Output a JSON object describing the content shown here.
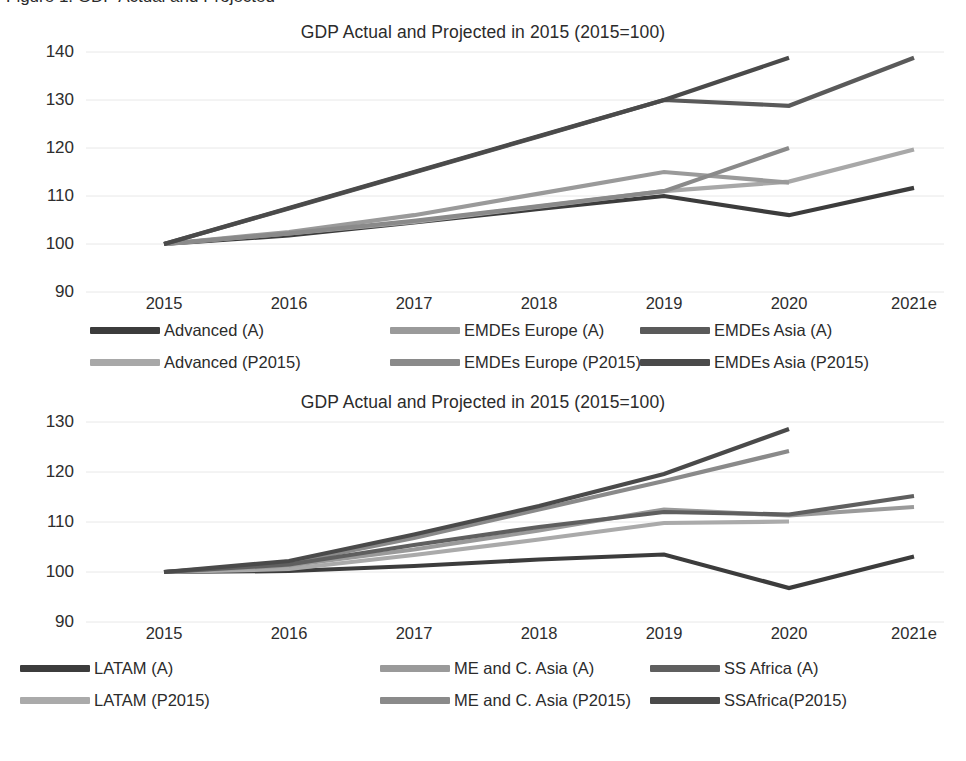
{
  "document": {
    "caption_partial": "Figure 1. GDP Actual and Projected"
  },
  "charts": [
    {
      "id": "chart-top",
      "title": "GDP Actual and Projected in 2015 (2015=100)",
      "y_ticks": [
        "140",
        "130",
        "120",
        "110",
        "100",
        "90"
      ],
      "x_ticks": [
        "2015",
        "2016",
        "2017",
        "2018",
        "2019",
        "2020",
        "2021e"
      ],
      "legend": [
        {
          "label": "Advanced (A)",
          "color": "#3c3c3c"
        },
        {
          "label": "EMDEs Europe (A)",
          "color": "#9a9a9a"
        },
        {
          "label": "EMDEs Asia (A)",
          "color": "#5a5a5a"
        },
        {
          "label": "Advanced (P2015)",
          "color": "#a8a8a8"
        },
        {
          "label": "EMDEs Europe (P2015)",
          "color": "#8a8a8a"
        },
        {
          "label": "EMDEs Asia (P2015)",
          "color": "#4a4a4a"
        }
      ]
    },
    {
      "id": "chart-bottom",
      "title": "GDP Actual and Projected in 2015 (2015=100)",
      "y_ticks": [
        "130",
        "120",
        "110",
        "100",
        "90"
      ],
      "x_ticks": [
        "2015",
        "2016",
        "2017",
        "2018",
        "2019",
        "2020",
        "2021e"
      ],
      "legend": [
        {
          "label": "LATAM (A)",
          "color": "#3c3c3c"
        },
        {
          "label": "ME and C. Asia (A)",
          "color": "#9a9a9a"
        },
        {
          "label": "SS Africa (A)",
          "color": "#5f5f5f"
        },
        {
          "label": "LATAM (P2015)",
          "color": "#aaaaaa"
        },
        {
          "label": "ME and C. Asia (P2015)",
          "color": "#8a8a8a"
        },
        {
          "label": "SSAfrica(P2015)",
          "color": "#4a4a4a"
        }
      ]
    }
  ],
  "chart_data": [
    {
      "type": "line",
      "title": "GDP Actual and Projected in 2015 (2015=100)",
      "xlabel": "",
      "ylabel": "",
      "ylim": [
        90,
        140
      ],
      "grid": true,
      "legend_position": "bottom",
      "categories": [
        "2015",
        "2016",
        "2017",
        "2018",
        "2019",
        "2020",
        "2021e"
      ],
      "series": [
        {
          "name": "Advanced (A)",
          "color": "#3c3c3c",
          "values": [
            100,
            101.8,
            104.5,
            107.3,
            110.0,
            106.0,
            111.7
          ]
        },
        {
          "name": "Advanced (P2015)",
          "color": "#a8a8a8",
          "values": [
            100,
            102.2,
            104.6,
            107.8,
            111.0,
            113.0,
            119.7
          ]
        },
        {
          "name": "EMDEs Europe (A)",
          "color": "#9a9a9a",
          "values": [
            100,
            102.5,
            106.0,
            110.5,
            115.0,
            112.8,
            null
          ]
        },
        {
          "name": "EMDEs Europe (P2015)",
          "color": "#8a8a8a",
          "values": [
            100,
            102.2,
            104.8,
            107.9,
            111.0,
            120.0,
            null
          ]
        },
        {
          "name": "EMDEs Asia (A)",
          "color": "#5a5a5a",
          "values": [
            100,
            107.4,
            114.9,
            122.4,
            130.0,
            128.8,
            138.8
          ]
        },
        {
          "name": "EMDEs Asia (P2015)",
          "color": "#4a4a4a",
          "values": [
            100,
            107.5,
            115.0,
            122.5,
            130.0,
            138.8,
            null
          ]
        }
      ]
    },
    {
      "type": "line",
      "title": "GDP Actual and Projected in 2015 (2015=100)",
      "xlabel": "",
      "ylabel": "",
      "ylim": [
        90,
        130
      ],
      "grid": true,
      "legend_position": "bottom",
      "categories": [
        "2015",
        "2016",
        "2017",
        "2018",
        "2019",
        "2020",
        "2021e"
      ],
      "series": [
        {
          "name": "LATAM (A)",
          "color": "#3c3c3c",
          "values": [
            100,
            100.2,
            101.2,
            102.5,
            103.5,
            96.8,
            103.1
          ]
        },
        {
          "name": "LATAM (P2015)",
          "color": "#aaaaaa",
          "values": [
            100,
            100.6,
            103.4,
            106.5,
            109.8,
            110.1,
            null
          ]
        },
        {
          "name": "ME and C. Asia (A)",
          "color": "#9a9a9a",
          "values": [
            100,
            101.3,
            104.5,
            108.3,
            112.5,
            111.3,
            113.0
          ]
        },
        {
          "name": "ME and C. Asia (P2015)",
          "color": "#8a8a8a",
          "values": [
            100,
            101.8,
            106.8,
            112.5,
            118.2,
            124.2,
            null
          ]
        },
        {
          "name": "SS Africa (A)",
          "color": "#5f5f5f",
          "values": [
            100,
            101.5,
            105.4,
            109.0,
            112.0,
            111.5,
            115.2
          ]
        },
        {
          "name": "SSAfrica(P2015)",
          "color": "#4a4a4a",
          "values": [
            100,
            102.2,
            107.5,
            113.2,
            119.6,
            128.6,
            null
          ]
        }
      ]
    }
  ]
}
